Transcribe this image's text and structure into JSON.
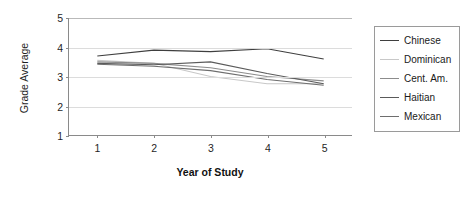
{
  "chart_data": {
    "type": "line",
    "title": "",
    "xlabel": "Year of Study",
    "ylabel": "Grade Average",
    "x": [
      1,
      2,
      3,
      4,
      5
    ],
    "xtick_labels": [
      "1",
      "2",
      "3",
      "4",
      "5"
    ],
    "ytick_labels": [
      "1",
      "2",
      "3",
      "4",
      "5"
    ],
    "xlim": [
      0.5,
      5.5
    ],
    "ylim": [
      1,
      5
    ],
    "grid": "horizontal",
    "legend_position": "right-outside",
    "categories": [
      "1",
      "2",
      "3",
      "4",
      "5"
    ],
    "series": [
      {
        "name": "Chinese",
        "color": "#3f3f3f",
        "values": [
          3.7,
          3.9,
          3.85,
          3.95,
          3.6
        ]
      },
      {
        "name": "Dominican",
        "color": "#c8c8c8",
        "values": [
          3.55,
          3.45,
          3.0,
          2.75,
          2.75
        ]
      },
      {
        "name": "Cent. Am.",
        "color": "#8c8c8c",
        "values": [
          3.5,
          3.45,
          3.3,
          3.0,
          2.85
        ]
      },
      {
        "name": "Haitian",
        "color": "#5a5a5a",
        "values": [
          3.45,
          3.4,
          3.5,
          3.1,
          2.75
        ]
      },
      {
        "name": "Mexican",
        "color": "#6e6e6e",
        "values": [
          3.42,
          3.35,
          3.2,
          2.9,
          2.7
        ]
      }
    ]
  },
  "legend": {
    "entries": [
      {
        "label": "Chinese"
      },
      {
        "label": "Dominican"
      },
      {
        "label": "Cent. Am."
      },
      {
        "label": "Haitian"
      },
      {
        "label": "Mexican"
      }
    ]
  },
  "axes": {
    "y_title": "Grade Average",
    "x_title": "Year of Study"
  }
}
